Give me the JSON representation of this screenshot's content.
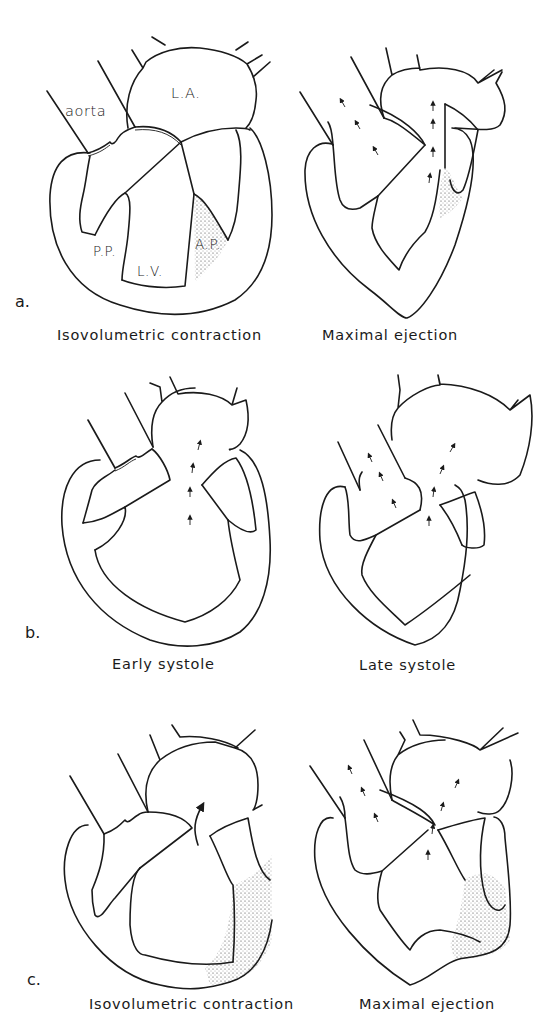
{
  "figure": {
    "panels": [
      {
        "letter": "a.",
        "left_caption": "Isovolumetric contraction",
        "right_caption": "Maximal ejection",
        "labels": {
          "aorta": "aorta",
          "left_atrium": "L.A.",
          "posterior_papillary": "P.P.",
          "left_ventricle": "L.V.",
          "anterior_papillary": "A.P."
        }
      },
      {
        "letter": "b.",
        "left_caption": "Early systole",
        "right_caption": "Late systole"
      },
      {
        "letter": "c.",
        "left_caption": "Isovolumetric contraction",
        "right_caption": "Maximal ejection"
      }
    ],
    "colors": {
      "ink": "#1a1a1a",
      "background": "#ffffff"
    }
  }
}
